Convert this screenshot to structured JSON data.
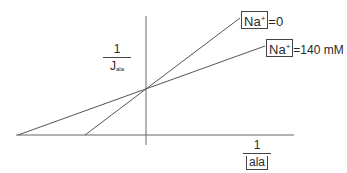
{
  "diagram": {
    "type": "Lineweaver-Burk double-reciprocal plot",
    "y_axis_label": {
      "numerator": "1",
      "denominator": "J",
      "denominator_sub": "ala"
    },
    "x_axis_label": {
      "numerator": "1",
      "denominator": "ala"
    },
    "lines": [
      {
        "label_ion": "Na",
        "label_charge": "+",
        "label_value": "=0",
        "color": "#555555"
      },
      {
        "label_ion": "Na",
        "label_charge": "+",
        "label_value": "=140 mM",
        "color": "#555555"
      }
    ]
  }
}
